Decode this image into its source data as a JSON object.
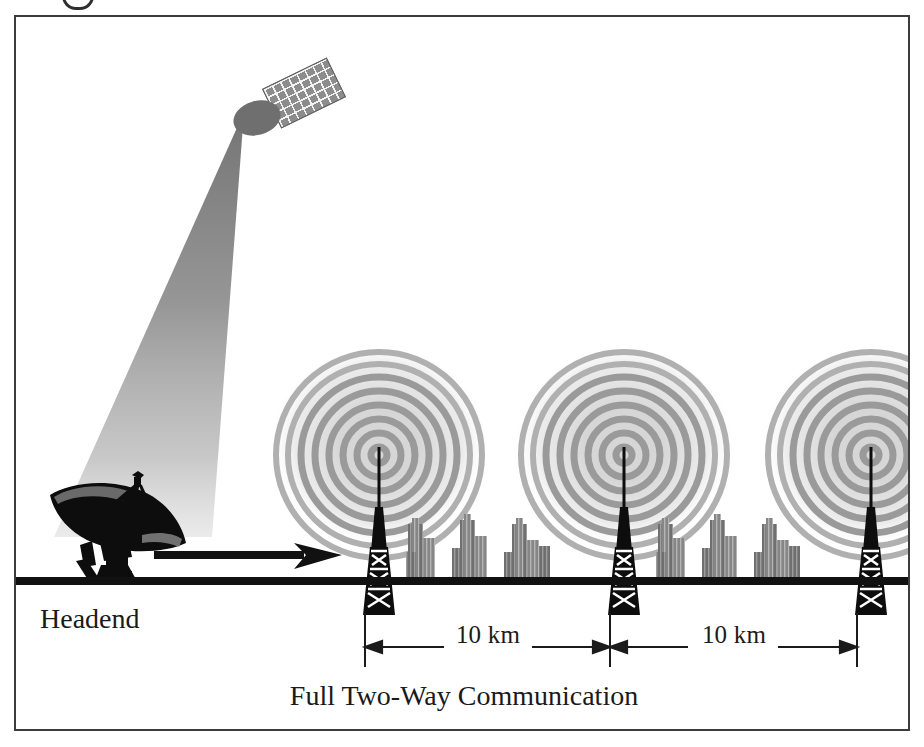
{
  "figure": {
    "kind": "wireless-cable-distribution-diagram",
    "headend_label": "Headend",
    "caption": "Full Two-Way Communication",
    "dimensions": [
      {
        "label": "10 km",
        "from_tower": 1,
        "to_tower": 2
      },
      {
        "label": "10 km",
        "from_tower": 2,
        "to_tower": 3
      }
    ],
    "elements": {
      "satellite_name": "satellite-icon",
      "satellite_panel_name": "solar-panel-icon",
      "beam_name": "satellite-downlink-beam",
      "dish_name": "headend-satellite-dish-icon",
      "arrow_name": "signal-flow-arrow",
      "tower_name": "transmission-tower-icon",
      "rings_name": "radio-wave-rings",
      "city_name": "city-buildings-icon",
      "ground_name": "ground-line"
    },
    "towers": [
      {
        "id": 1,
        "x": 363
      },
      {
        "id": 2,
        "x": 608
      },
      {
        "id": 3,
        "x": 855
      }
    ],
    "cities": [
      {
        "id": 1,
        "x": 404
      },
      {
        "id": 2,
        "x": 655
      }
    ],
    "colors": {
      "frame": "#3c3c3c",
      "ground": "#111111",
      "ink": "#1a1a1a",
      "ring": "#9a9a9a",
      "ring_halo": "#d8d8d8",
      "beam": "#8a8a8a",
      "satellite_body": "#6f6f6f",
      "building": "#6a6a6a",
      "background": "#ffffff"
    }
  }
}
